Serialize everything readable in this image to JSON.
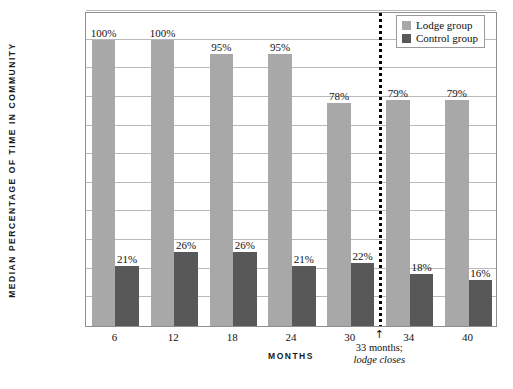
{
  "chart_data": {
    "type": "bar",
    "title": "",
    "xlabel": "MONTHS",
    "ylabel": "MEDIAN PERCENTAGE OF TIME IN COMMUNITY",
    "categories": [
      "6",
      "12",
      "18",
      "24",
      "30",
      "34",
      "40"
    ],
    "series": [
      {
        "name": "Lodge group",
        "color": "#a8a8a8",
        "values": [
          100,
          100,
          95,
          95,
          78,
          79,
          79
        ],
        "labels": [
          "100%",
          "100%",
          "95%",
          "95%",
          "78%",
          "79%",
          "79%"
        ]
      },
      {
        "name": "Control group",
        "color": "#585858",
        "values": [
          21,
          26,
          26,
          21,
          22,
          18,
          16
        ],
        "labels": [
          "21%",
          "26%",
          "26%",
          "21%",
          "22%",
          "18%",
          "16%"
        ]
      }
    ],
    "ylim": [
      0,
      110
    ],
    "ytick_step": 10,
    "grid": true,
    "legend_position": "top-right",
    "annotations": [
      {
        "name": "lodge-closes-marker",
        "after_category": "30",
        "arrow": "↑",
        "line1": "33 months;",
        "line2": "lodge closes",
        "divider_style": "dotted-vertical"
      }
    ]
  },
  "legend": {
    "items": [
      {
        "label": "Lodge group",
        "color": "#a8a8a8"
      },
      {
        "label": "Control group",
        "color": "#585858"
      }
    ]
  }
}
